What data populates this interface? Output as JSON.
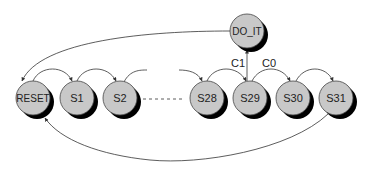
{
  "diagram": {
    "type": "state-machine",
    "colors": {
      "node_fill": "#c8c8c8",
      "node_stroke": "#444444",
      "shadow": "#000000",
      "edge": "#333333",
      "background": "#ffffff"
    },
    "nodes": [
      {
        "id": "RESET",
        "label": "RESET"
      },
      {
        "id": "S1",
        "label": "S1"
      },
      {
        "id": "S2",
        "label": "S2"
      },
      {
        "id": "S28",
        "label": "S28"
      },
      {
        "id": "S29",
        "label": "S29"
      },
      {
        "id": "S30",
        "label": "S30"
      },
      {
        "id": "S31",
        "label": "S31"
      },
      {
        "id": "DO_IT",
        "label": "DO_IT"
      }
    ],
    "edges": [
      {
        "from": "RESET",
        "to": "S1",
        "label": ""
      },
      {
        "from": "S1",
        "to": "S2",
        "label": ""
      },
      {
        "from": "S2",
        "to": "...",
        "label": ""
      },
      {
        "from": "...",
        "to": "S28",
        "label": ""
      },
      {
        "from": "S28",
        "to": "S29",
        "label": ""
      },
      {
        "from": "S29",
        "to": "S30",
        "label": "C0"
      },
      {
        "from": "S29",
        "to": "DO_IT",
        "label": "C1"
      },
      {
        "from": "S30",
        "to": "S31",
        "label": ""
      },
      {
        "from": "DO_IT",
        "to": "RESET",
        "label": ""
      },
      {
        "from": "S31",
        "to": "RESET",
        "label": ""
      }
    ],
    "edge_labels": {
      "c1": "C1",
      "c0": "C0"
    },
    "ellipsis": "-------"
  }
}
